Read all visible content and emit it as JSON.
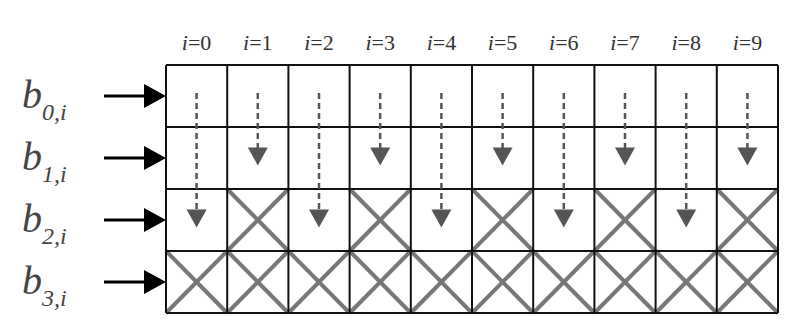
{
  "columns": [
    "0",
    "1",
    "2",
    "3",
    "4",
    "5",
    "6",
    "7",
    "8",
    "9"
  ],
  "column_prefix": "i=",
  "rows": [
    {
      "base": "b",
      "sub": "0,i"
    },
    {
      "base": "b",
      "sub": "1,i"
    },
    {
      "base": "b",
      "sub": "2,i"
    },
    {
      "base": "b",
      "sub": "3,i"
    }
  ],
  "arrow_end_row": [
    2,
    1,
    2,
    1,
    2,
    1,
    2,
    1,
    2,
    1
  ],
  "crossed_from_row": [
    3,
    2,
    3,
    2,
    3,
    2,
    3,
    2,
    3,
    2
  ],
  "colors": {
    "grid": "#111111",
    "cross": "#777777",
    "arrow": "#555555",
    "input_arrow": "#000000"
  }
}
